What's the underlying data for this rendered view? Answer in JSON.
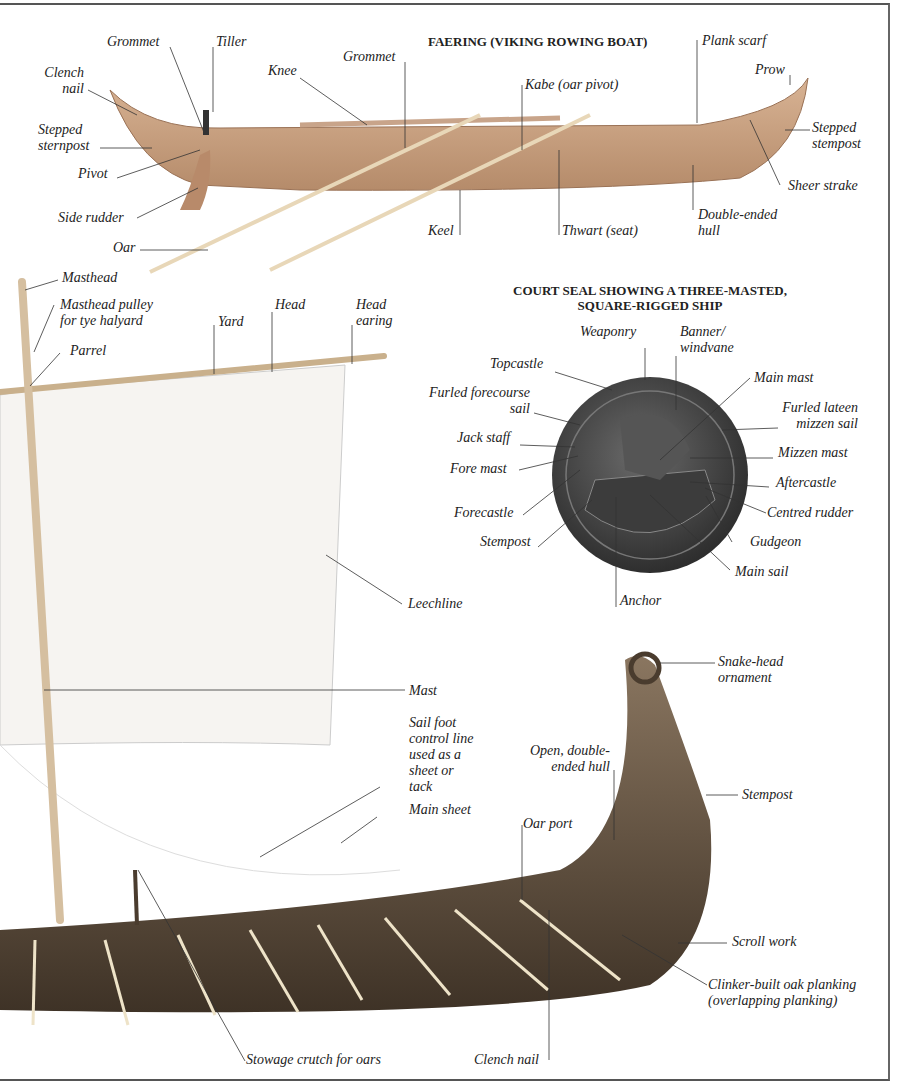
{
  "faering": {
    "title": "FAERING (VIKING ROWING BOAT)",
    "labels": {
      "grommet_1": "Grommet",
      "tiller": "Tiller",
      "clench_nail": "Clench\nnail",
      "knee": "Knee",
      "grommet_2": "Grommet",
      "kabe": "Kabe (oar pivot)",
      "plank_scarf": "Plank scarf",
      "prow": "Prow",
      "stepped_stempost": "Stepped\nstempost",
      "stepped_sternpost": "Stepped\nsternpost",
      "pivot": "Pivot",
      "sheer_strake": "Sheer strake",
      "side_rudder": "Side rudder",
      "double_ended_hull": "Double-ended\nhull",
      "keel": "Keel",
      "thwart": "Thwart (seat)",
      "oar": "Oar"
    }
  },
  "sail": {
    "labels": {
      "masthead": "Masthead",
      "masthead_pulley": "Masthead pulley\nfor tye halyard",
      "yard": "Yard",
      "head": "Head",
      "head_earing": "Head\nearing",
      "parrel": "Parrel",
      "leechline": "Leechline",
      "mast": "Mast",
      "sail_foot": "Sail foot\ncontrol line\nused as a\nsheet or\ntack",
      "main_sheet": "Main sheet"
    }
  },
  "seal": {
    "title": "COURT SEAL SHOWING A THREE-MASTED,\nSQUARE-RIGGED SHIP",
    "labels": {
      "weaponry": "Weaponry",
      "banner": "Banner/\nwindvane",
      "topcastle": "Topcastle",
      "main_mast": "Main mast",
      "furled_forecourse": "Furled forecourse\nsail",
      "furled_lateen": "Furled lateen\nmizzen sail",
      "jack_staff": "Jack staff",
      "mizzen_mast": "Mizzen mast",
      "fore_mast": "Fore mast",
      "aftercastle": "Aftercastle",
      "forecastle": "Forecastle",
      "centred_rudder": "Centred rudder",
      "stempost": "Stempost",
      "gudgeon": "Gudgeon",
      "main_sail": "Main sail",
      "anchor": "Anchor"
    }
  },
  "longship": {
    "labels": {
      "snake_head": "Snake-head\nornament",
      "open_hull": "Open, double-\nended hull",
      "stempost": "Stempost",
      "oar_port": "Oar port",
      "scroll_work": "Scroll work",
      "clinker": "Clinker-built oak planking\n(overlapping planking)",
      "stowage": "Stowage crutch for oars",
      "clench_nail": "Clench nail"
    }
  },
  "colors": {
    "faering_wood": "#c9a07e",
    "seal_metal": "#4a4a4a",
    "longship_wood": "#6e5a44",
    "leader_line": "#333333"
  }
}
